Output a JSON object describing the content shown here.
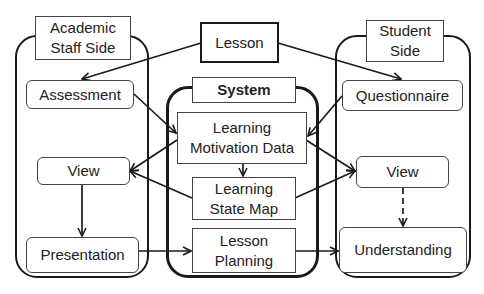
{
  "diagram": {
    "containers": {
      "staff": {
        "label": "Academic\nStaff Side"
      },
      "system": {
        "label": "System"
      },
      "student": {
        "label": "Student\nSide"
      }
    },
    "nodes": {
      "lesson": "Lesson",
      "assessment": "Assessment",
      "view_staff": "View",
      "presentation": "Presentation",
      "learning_motivation_data": "Learning\nMotivation Data",
      "learning_state_map": "Learning\nState Map",
      "lesson_planning": "Lesson\nPlanning",
      "questionnaire": "Questionnaire",
      "view_student": "View",
      "understanding": "Understanding"
    },
    "edges": [
      {
        "from": "Lesson",
        "to": "Assessment",
        "style": "solid"
      },
      {
        "from": "Lesson",
        "to": "Questionnaire",
        "style": "solid"
      },
      {
        "from": "Assessment",
        "to": "Learning Motivation Data",
        "style": "solid"
      },
      {
        "from": "Questionnaire",
        "to": "Learning Motivation Data",
        "style": "solid"
      },
      {
        "from": "Learning Motivation Data",
        "to": "View (Staff)",
        "style": "solid"
      },
      {
        "from": "Learning Motivation Data",
        "to": "View (Student)",
        "style": "solid"
      },
      {
        "from": "Learning Motivation Data",
        "to": "Learning State Map",
        "style": "solid"
      },
      {
        "from": "Learning State Map",
        "to": "View (Staff)",
        "style": "solid"
      },
      {
        "from": "Learning State Map",
        "to": "View (Student)",
        "style": "solid"
      },
      {
        "from": "View (Staff)",
        "to": "Presentation",
        "style": "solid"
      },
      {
        "from": "Presentation",
        "to": "Lesson Planning",
        "style": "solid"
      },
      {
        "from": "Lesson Planning",
        "to": "Understanding",
        "style": "solid"
      },
      {
        "from": "View (Student)",
        "to": "Understanding",
        "style": "dashed"
      }
    ],
    "colors": {
      "stroke": "#1a1a1a",
      "background": "#ffffff"
    }
  }
}
